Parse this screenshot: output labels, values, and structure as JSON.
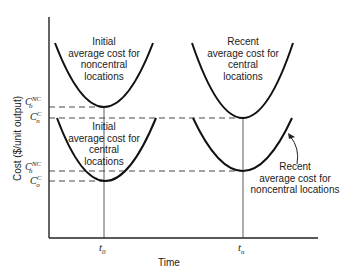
{
  "diagram": {
    "axes": {
      "x_title": "Time",
      "y_title": "Cost ($/unit output)",
      "x_ticks": [
        {
          "base": "t",
          "sub": "0"
        },
        {
          "base": "t",
          "sub": "n"
        }
      ],
      "y_levels": [
        {
          "base": "C",
          "sup": "NC",
          "sub": "o"
        },
        {
          "base": "C",
          "sup": "C",
          "sub": "n"
        },
        {
          "base": "C",
          "sup": "NC",
          "sub": "n"
        },
        {
          "base": "C",
          "sup": "C",
          "sub": "o"
        }
      ]
    },
    "curves": [
      {
        "id": "initial-noncentral",
        "lines": [
          "Initial",
          "average cost for",
          "noncentral",
          "locations"
        ]
      },
      {
        "id": "initial-central",
        "lines": [
          "Initial",
          "average cost for",
          "central",
          "locations"
        ]
      },
      {
        "id": "recent-central",
        "lines": [
          "Recent",
          "average cost for",
          "central",
          "locations"
        ]
      },
      {
        "id": "recent-noncentral",
        "lines": [
          "Recent",
          "average cost for",
          "noncentral locations"
        ]
      }
    ]
  }
}
